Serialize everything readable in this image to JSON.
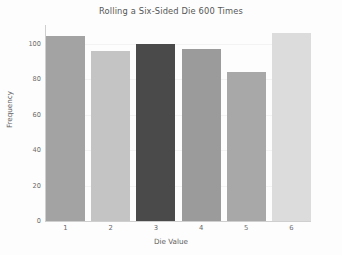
{
  "chart_data": {
    "type": "bar",
    "title": "Rolling a Six-Sided Die 600 Times",
    "xlabel": "Die Value",
    "ylabel": "Frequency",
    "categories": [
      "1",
      "2",
      "3",
      "4",
      "5",
      "6"
    ],
    "values": [
      104,
      96,
      100,
      97,
      84,
      106
    ],
    "bar_colors": [
      "#a3a3a3",
      "#c4c4c4",
      "#4a4a4a",
      "#9b9b9b",
      "#a8a8a8",
      "#dcdcdc"
    ],
    "ylim": [
      0,
      120
    ],
    "y_ticks": [
      {
        "label": "0",
        "value": 0
      },
      {
        "label": "20",
        "value": 20
      },
      {
        "label": "40",
        "value": 40
      },
      {
        "label": "60",
        "value": 60
      },
      {
        "label": "80",
        "value": 80
      },
      {
        "label": "100",
        "value": 100
      }
    ],
    "grid": true,
    "legend": null,
    "background_color": "#fdfdfd",
    "axis_color": "#cfcfcf",
    "text_color": "#5e5e5e"
  }
}
